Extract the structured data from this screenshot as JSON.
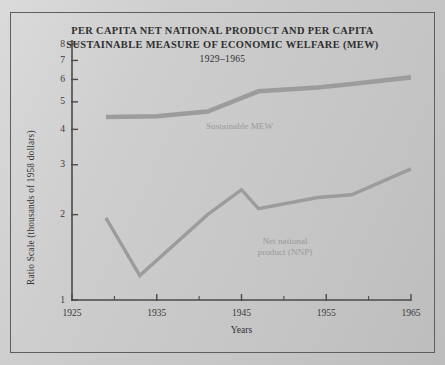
{
  "figure": {
    "title_line1": "PER CAPITA NET NATIONAL PRODUCT AND PER CAPITA",
    "title_line2": "SUSTAINABLE MEASURE OF ECONOMIC WELFARE (MEW)",
    "subtitle": "1929–1965",
    "background_color": "#cbcbcb",
    "frame_color": "#5e5e5e",
    "series_color": "#9c9c9c",
    "axis_color": "#4a4a4a"
  },
  "annotations": {
    "mew_label": "Sustainable MEW",
    "nnp_label_line1": "Net national",
    "nnp_label_line2": "product (NNP)"
  },
  "chart_data": {
    "type": "line",
    "subtitle": "1929–1965",
    "xlabel": "Years",
    "ylabel": "Ratio Scale (thousands of 1958 dollars)",
    "yscale": "log",
    "xlim": [
      1925,
      1965
    ],
    "ylim": [
      1,
      8
    ],
    "grid": false,
    "legend": "inline-labels",
    "xticks": [
      1925,
      1935,
      1945,
      1955,
      1965
    ],
    "xticks_minor": [
      1930,
      1940,
      1950,
      1960
    ],
    "yticks": [
      1,
      2,
      3,
      4,
      5,
      6,
      7,
      8
    ],
    "ytick_labels": [
      "1",
      "2",
      "3",
      "4",
      "5",
      "6",
      "7",
      "8"
    ],
    "series": [
      {
        "name": "Sustainable MEW",
        "x": [
          1929,
          1935,
          1941,
          1947,
          1954,
          1958,
          1965
        ],
        "values": [
          4.42,
          4.45,
          4.62,
          5.45,
          5.62,
          5.78,
          6.1
        ]
      },
      {
        "name": "Net national product (NNP)",
        "x": [
          1929,
          1933,
          1941,
          1945,
          1947,
          1954,
          1958,
          1965
        ],
        "values": [
          1.95,
          1.22,
          2.0,
          2.45,
          2.1,
          2.3,
          2.35,
          2.9
        ]
      }
    ]
  }
}
